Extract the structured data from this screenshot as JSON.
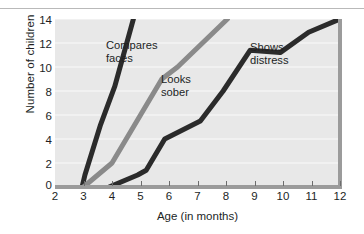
{
  "chart_data": {
    "type": "line",
    "title": "",
    "subtitle": "",
    "xlabel": "Age (in months)",
    "ylabel": "Number of children",
    "xlim": [
      2,
      12
    ],
    "ylim": [
      0,
      14
    ],
    "xticks": [
      2,
      3,
      4,
      5,
      6,
      7,
      8,
      9,
      10,
      11,
      12
    ],
    "yticks": [
      0,
      2,
      4,
      6,
      8,
      10,
      12,
      14
    ],
    "grid": "horizontal",
    "legend": "inline-annotations",
    "plot_background": "#e8e8e8",
    "series": [
      {
        "name": "Compares faces",
        "color": "#2b2b2b",
        "label_position": "inline",
        "points": [
          {
            "x": 2.95,
            "y": 0
          },
          {
            "x": 3.05,
            "y": 1.0
          },
          {
            "x": 3.6,
            "y": 5.2
          },
          {
            "x": 4.1,
            "y": 8.4
          },
          {
            "x": 4.75,
            "y": 14
          }
        ]
      },
      {
        "name": "Looks sober",
        "color": "#8a8a8a",
        "label_position": "inline",
        "points": [
          {
            "x": 3.0,
            "y": 0
          },
          {
            "x": 4.0,
            "y": 2.0
          },
          {
            "x": 5.0,
            "y": 6.0
          },
          {
            "x": 5.75,
            "y": 9.0
          },
          {
            "x": 6.3,
            "y": 10.0
          },
          {
            "x": 8.05,
            "y": 14
          }
        ]
      },
      {
        "name": "Shows distress",
        "color": "#2b2b2b",
        "label_position": "inline",
        "points": [
          {
            "x": 3.9,
            "y": 0
          },
          {
            "x": 4.9,
            "y": 1.0
          },
          {
            "x": 5.2,
            "y": 1.4
          },
          {
            "x": 5.85,
            "y": 4.0
          },
          {
            "x": 7.1,
            "y": 5.5
          },
          {
            "x": 7.9,
            "y": 8.0
          },
          {
            "x": 8.85,
            "y": 11.4
          },
          {
            "x": 9.9,
            "y": 11.2
          },
          {
            "x": 10.9,
            "y": 12.9
          },
          {
            "x": 12.0,
            "y": 14
          }
        ]
      }
    ]
  },
  "axes": {
    "y_title": "Number of children",
    "x_title": "Age (in months)",
    "y_tick_labels": [
      "14",
      "12",
      "10",
      "8",
      "6",
      "4",
      "2",
      "0"
    ],
    "x_tick_labels": [
      "2",
      "3",
      "4",
      "5",
      "6",
      "7",
      "8",
      "9",
      "10",
      "11",
      "12"
    ]
  },
  "annotations": {
    "compares_faces": "Compares\nfaces",
    "looks_sober": "Looks\nsober",
    "shows_distress": "Shows\ndistress"
  },
  "colors": {
    "dark_line": "#2b2b2b",
    "gray_line": "#8a8a8a",
    "plot_bg": "#e8e8e8",
    "axis": "#9b9b9b",
    "gridline": "#f5f5f5",
    "text": "#221f1f"
  }
}
